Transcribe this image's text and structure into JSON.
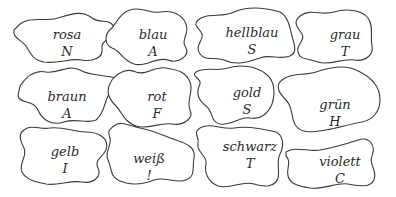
{
  "pieces": [
    {
      "word": "rosa",
      "letter": "N"
    },
    {
      "word": "blau",
      "letter": "A"
    },
    {
      "word": "hellblau",
      "letter": "S"
    },
    {
      "word": "grau",
      "letter": "T"
    },
    {
      "word": "braun",
      "letter": "A"
    },
    {
      "word": "rot",
      "letter": "F"
    },
    {
      "word": "gold",
      "letter": "S"
    },
    {
      "word": "grün",
      "letter": "H"
    },
    {
      "word": "gelb",
      "letter": "I"
    },
    {
      "word": "weiß",
      "letter": "!"
    },
    {
      "word": "schwarz",
      "letter": "T"
    },
    {
      "word": "violett",
      "letter": "C"
    }
  ],
  "colors": {
    "outline": "#3a3a3a",
    "text": "#2a2a2a",
    "background": "#ffffff"
  }
}
